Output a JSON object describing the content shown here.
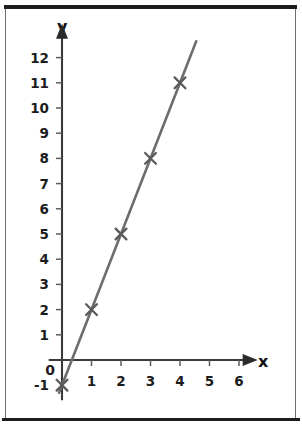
{
  "chart_data": {
    "type": "line",
    "title": "",
    "subtitle": "",
    "xlabel": "x",
    "ylabel": "y",
    "x": [
      0,
      1,
      2,
      3,
      4
    ],
    "values": [
      -1,
      2,
      5,
      8,
      11
    ],
    "series": [
      {
        "name": "line",
        "x": [
          0,
          1,
          2,
          3,
          4
        ],
        "values": [
          -1,
          2,
          5,
          8,
          11
        ]
      }
    ],
    "points": [
      {
        "x": 0,
        "y": -1
      },
      {
        "x": 1,
        "y": 2
      },
      {
        "x": 2,
        "y": 5
      },
      {
        "x": 3,
        "y": 8
      },
      {
        "x": 4,
        "y": 11
      }
    ],
    "xlim": [
      -0.45,
      6.6
    ],
    "ylim": [
      -1.6,
      13.3
    ],
    "line_extent": {
      "x_start": -0.1,
      "x_end": 4.55
    },
    "xticks": [
      1,
      2,
      3,
      4,
      5,
      6
    ],
    "xtick_labels": [
      "1",
      "2",
      "3",
      "4",
      "5",
      "6"
    ],
    "yticks": [
      1,
      2,
      3,
      4,
      5,
      6,
      7,
      8,
      9,
      10,
      11,
      12
    ],
    "ytick_labels": [
      "1",
      "2",
      "3",
      "4",
      "5",
      "6",
      "7",
      "8",
      "9",
      "10",
      "11",
      "12"
    ],
    "negative_y_label": "-1",
    "origin_label": "0",
    "grid": false,
    "legend": false,
    "legend_position": "none",
    "marker_style": "cross",
    "colors": {
      "line": "#6d6d6d",
      "marker": "#5a5a5a",
      "axis": "#3a3a3a",
      "tick": "#5c5c5c",
      "text": "#1c1c1c",
      "frame": "#1d1d1d",
      "background": "#ffffff"
    }
  }
}
